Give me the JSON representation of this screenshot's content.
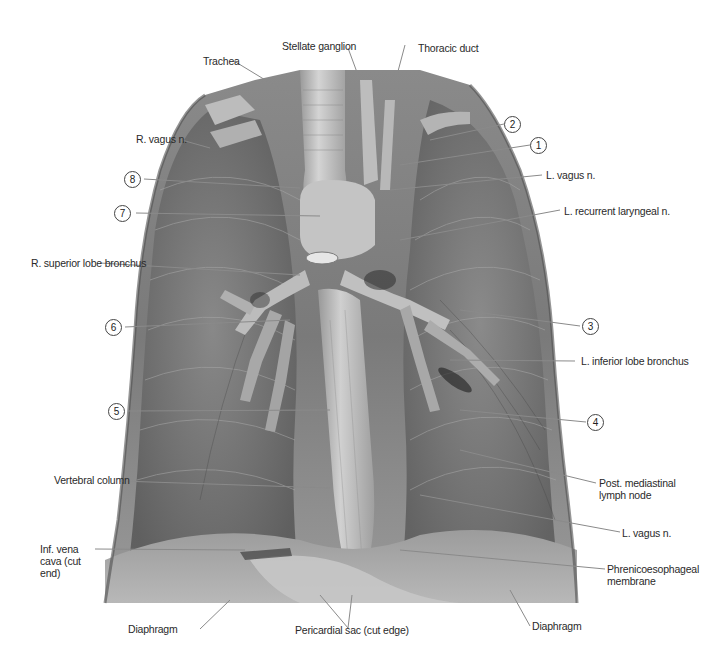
{
  "figure": {
    "type": "anatomical photograph",
    "view": "posterior mediastinum, grayscale dissection",
    "labels": {
      "stellate_ganglion": "Stellate ganglion",
      "thoracic_duct": "Thoracic duct",
      "trachea": "Trachea",
      "r_vagus": "R. vagus n.",
      "l_vagus_upper": "L. vagus n.",
      "l_recurrent_laryngeal": "L. recurrent laryngeal n.",
      "r_superior_lobe_bronchus": "R. superior lobe bronchus",
      "l_inferior_lobe_bronchus": "L. inferior lobe bronchus",
      "post_mediastinal_lymph_node": "Post. mediastinal lymph node",
      "vertebral_column": "Vertebral column",
      "l_vagus_lower": "L. vagus n.",
      "inf_vena_cava": "Inf. vena cava (cut end)",
      "phrenicoesophageal_membrane": "Phrenicoesophageal membrane",
      "diaphragm_left": "Diaphragm",
      "pericardial_sac": "Pericardial sac (cut edge)",
      "diaphragm_right": "Diaphragm"
    },
    "numbered_callouts": {
      "n1": "1",
      "n2": "2",
      "n3": "3",
      "n4": "4",
      "n5": "5",
      "n6": "6",
      "n7": "7",
      "n8": "8"
    }
  }
}
